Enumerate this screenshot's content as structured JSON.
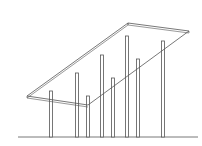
{
  "diagram": {
    "colors": {
      "stroke": "#555555",
      "background": "#ffffff"
    },
    "ground": {
      "x1": 18,
      "x2": 198,
      "y": 137
    },
    "slab": {
      "top": [
        [
          27,
          96
        ],
        [
          128,
          23
        ],
        [
          189,
          31
        ],
        [
          88,
          105
        ]
      ],
      "thickness": 2
    },
    "columns": [
      {
        "x": 51,
        "top": 91
      },
      {
        "x": 77,
        "top": 73
      },
      {
        "x": 88,
        "top": 96
      },
      {
        "x": 102,
        "top": 55
      },
      {
        "x": 113,
        "top": 78
      },
      {
        "x": 127,
        "top": 36
      },
      {
        "x": 138,
        "top": 59
      },
      {
        "x": 163,
        "top": 41
      }
    ]
  }
}
